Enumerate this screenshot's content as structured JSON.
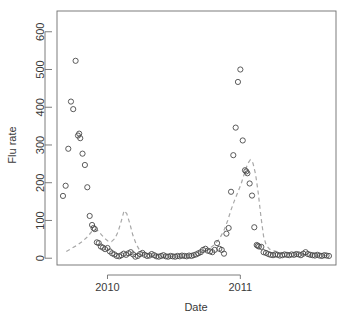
{
  "chart_data": {
    "type": "scatter",
    "title": "",
    "xlabel": "Date",
    "ylabel": "Flu rate",
    "xlim": [
      2009.62,
      2011.72
    ],
    "ylim": [
      -18,
      655
    ],
    "grid": false,
    "legend": null,
    "xticks": [
      2010,
      2011
    ],
    "xticklabels": [
      "2010",
      "2011"
    ],
    "yticks": [
      0,
      100,
      200,
      300,
      400,
      500,
      600
    ],
    "yticklabels": [
      "0",
      "100",
      "200",
      "300",
      "400",
      "500",
      "600"
    ],
    "series": [
      {
        "name": "Observed flu rate",
        "type": "scatter",
        "marker": "open-circle",
        "color": "#4a4a4a",
        "points": [
          [
            2009.665,
            165
          ],
          [
            2009.685,
            192
          ],
          [
            2009.705,
            290
          ],
          [
            2009.725,
            415
          ],
          [
            2009.742,
            395
          ],
          [
            2009.76,
            523
          ],
          [
            2009.778,
            325
          ],
          [
            2009.787,
            330
          ],
          [
            2009.795,
            318
          ],
          [
            2009.812,
            277
          ],
          [
            2009.83,
            247
          ],
          [
            2009.848,
            188
          ],
          [
            2009.866,
            112
          ],
          [
            2009.884,
            88
          ],
          [
            2009.895,
            80
          ],
          [
            2009.905,
            77
          ],
          [
            2009.92,
            42
          ],
          [
            2009.934,
            40
          ],
          [
            2009.95,
            31
          ],
          [
            2009.966,
            28
          ],
          [
            2009.982,
            24
          ],
          [
            2010.0,
            27
          ],
          [
            2010.018,
            18
          ],
          [
            2010.035,
            13
          ],
          [
            2010.052,
            10
          ],
          [
            2010.07,
            6
          ],
          [
            2010.088,
            5
          ],
          [
            2010.105,
            8
          ],
          [
            2010.122,
            12
          ],
          [
            2010.14,
            9
          ],
          [
            2010.158,
            13
          ],
          [
            2010.175,
            16
          ],
          [
            2010.193,
            10
          ],
          [
            2010.21,
            4
          ],
          [
            2010.228,
            6
          ],
          [
            2010.245,
            11
          ],
          [
            2010.263,
            14
          ],
          [
            2010.28,
            9
          ],
          [
            2010.298,
            6
          ],
          [
            2010.316,
            7
          ],
          [
            2010.333,
            11
          ],
          [
            2010.351,
            8
          ],
          [
            2010.368,
            5
          ],
          [
            2010.386,
            4
          ],
          [
            2010.404,
            6
          ],
          [
            2010.421,
            8
          ],
          [
            2010.439,
            5
          ],
          [
            2010.456,
            4
          ],
          [
            2010.474,
            6
          ],
          [
            2010.491,
            5
          ],
          [
            2010.509,
            4
          ],
          [
            2010.526,
            6
          ],
          [
            2010.544,
            5
          ],
          [
            2010.561,
            7
          ],
          [
            2010.579,
            6
          ],
          [
            2010.596,
            5
          ],
          [
            2010.614,
            7
          ],
          [
            2010.632,
            6
          ],
          [
            2010.649,
            8
          ],
          [
            2010.667,
            10
          ],
          [
            2010.684,
            13
          ],
          [
            2010.702,
            16
          ],
          [
            2010.719,
            22
          ],
          [
            2010.737,
            25
          ],
          [
            2010.754,
            20
          ],
          [
            2010.772,
            18
          ],
          [
            2010.789,
            16
          ],
          [
            2010.807,
            22
          ],
          [
            2010.825,
            40
          ],
          [
            2010.842,
            25
          ],
          [
            2010.86,
            22
          ],
          [
            2010.877,
            12
          ],
          [
            2010.895,
            65
          ],
          [
            2010.912,
            80
          ],
          [
            2010.93,
            176
          ],
          [
            2010.947,
            273
          ],
          [
            2010.965,
            346
          ],
          [
            2010.982,
            467
          ],
          [
            2011.0,
            500
          ],
          [
            2011.018,
            312
          ],
          [
            2011.035,
            233
          ],
          [
            2011.045,
            230
          ],
          [
            2011.053,
            225
          ],
          [
            2011.07,
            198
          ],
          [
            2011.088,
            166
          ],
          [
            2011.105,
            82
          ],
          [
            2011.123,
            35
          ],
          [
            2011.131,
            33
          ],
          [
            2011.14,
            31
          ],
          [
            2011.158,
            30
          ],
          [
            2011.175,
            16
          ],
          [
            2011.193,
            14
          ],
          [
            2011.211,
            11
          ],
          [
            2011.228,
            9
          ],
          [
            2011.246,
            8
          ],
          [
            2011.263,
            10
          ],
          [
            2011.281,
            9
          ],
          [
            2011.298,
            7
          ],
          [
            2011.316,
            8
          ],
          [
            2011.333,
            10
          ],
          [
            2011.351,
            9
          ],
          [
            2011.368,
            8
          ],
          [
            2011.386,
            10
          ],
          [
            2011.404,
            9
          ],
          [
            2011.421,
            11
          ],
          [
            2011.439,
            10
          ],
          [
            2011.456,
            8
          ],
          [
            2011.474,
            12
          ],
          [
            2011.491,
            16
          ],
          [
            2011.509,
            11
          ],
          [
            2011.526,
            9
          ],
          [
            2011.544,
            8
          ],
          [
            2011.561,
            7
          ],
          [
            2011.579,
            9
          ],
          [
            2011.596,
            7
          ],
          [
            2011.614,
            6
          ],
          [
            2011.632,
            8
          ],
          [
            2011.649,
            7
          ],
          [
            2011.667,
            6
          ]
        ]
      },
      {
        "name": "Fitted trend",
        "type": "line",
        "style": "dashed",
        "color": "#a8a8a8",
        "points": [
          [
            2009.69,
            18
          ],
          [
            2009.73,
            26
          ],
          [
            2009.77,
            34
          ],
          [
            2009.81,
            44
          ],
          [
            2009.85,
            57
          ],
          [
            2009.88,
            70
          ],
          [
            2009.905,
            76
          ],
          [
            2009.93,
            72
          ],
          [
            2009.955,
            62
          ],
          [
            2009.98,
            52
          ],
          [
            2010.005,
            45
          ],
          [
            2010.03,
            44
          ],
          [
            2010.055,
            52
          ],
          [
            2010.08,
            70
          ],
          [
            2010.105,
            100
          ],
          [
            2010.125,
            126
          ],
          [
            2010.145,
            118
          ],
          [
            2010.168,
            92
          ],
          [
            2010.19,
            62
          ],
          [
            2010.215,
            38
          ],
          [
            2010.24,
            22
          ],
          [
            2010.27,
            14
          ],
          [
            2010.3,
            10
          ],
          [
            2010.34,
            8
          ],
          [
            2010.4,
            6
          ],
          [
            2010.46,
            5
          ],
          [
            2010.52,
            5
          ],
          [
            2010.58,
            6
          ],
          [
            2010.64,
            8
          ],
          [
            2010.7,
            14
          ],
          [
            2010.75,
            22
          ],
          [
            2010.8,
            34
          ],
          [
            2010.84,
            50
          ],
          [
            2010.875,
            72
          ],
          [
            2010.905,
            100
          ],
          [
            2010.93,
            128
          ],
          [
            2010.955,
            152
          ],
          [
            2010.98,
            174
          ],
          [
            2011.005,
            196
          ],
          [
            2011.03,
            224
          ],
          [
            2011.055,
            250
          ],
          [
            2011.075,
            261
          ],
          [
            2011.095,
            252
          ],
          [
            2011.115,
            222
          ],
          [
            2011.135,
            172
          ],
          [
            2011.155,
            110
          ],
          [
            2011.175,
            58
          ],
          [
            2011.195,
            34
          ],
          [
            2011.22,
            24
          ],
          [
            2011.25,
            20
          ],
          [
            2011.29,
            16
          ],
          [
            2011.34,
            13
          ],
          [
            2011.4,
            11
          ],
          [
            2011.46,
            10
          ],
          [
            2011.52,
            9
          ],
          [
            2011.58,
            8
          ],
          [
            2011.64,
            7
          ],
          [
            2011.68,
            6
          ]
        ]
      }
    ]
  },
  "layout": {
    "plot_box": {
      "left": 57,
      "right": 336,
      "top": 11,
      "bottom": 265
    },
    "marker_radius": 2.6,
    "axis_color": "#6e6e6e",
    "marker_color": "#4a4a4a",
    "trend_color": "#a8a8a8",
    "background": "#ffffff"
  }
}
